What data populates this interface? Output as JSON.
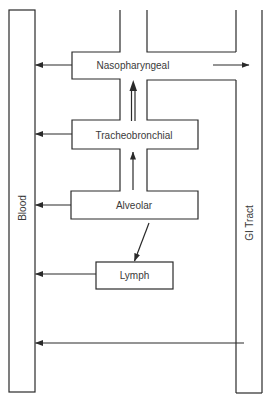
{
  "diagram": {
    "compartments": {
      "blood": "Blood",
      "gi_tract": "GI Tract",
      "nasopharyngeal": "Nasopharyngeal",
      "tracheobronchial": "Tracheobronchial",
      "alveolar": "Alveolar",
      "lymph": "Lymph"
    },
    "flows": [
      {
        "from": "Nasopharyngeal",
        "to": "Blood"
      },
      {
        "from": "Nasopharyngeal",
        "to": "GI Tract"
      },
      {
        "from": "Tracheobronchial",
        "to": "Blood"
      },
      {
        "from": "Tracheobronchial",
        "to": "Nasopharyngeal",
        "style": "double-shaft"
      },
      {
        "from": "Alveolar",
        "to": "Blood"
      },
      {
        "from": "Alveolar",
        "to": "Tracheobronchial"
      },
      {
        "from": "Alveolar",
        "to": "Lymph"
      },
      {
        "from": "Lymph",
        "to": "Blood"
      },
      {
        "from": "GI Tract",
        "to": "Blood"
      }
    ],
    "colors": {
      "line": "#2a2a2a",
      "text": "#3a3a3a",
      "background": "#ffffff"
    }
  }
}
